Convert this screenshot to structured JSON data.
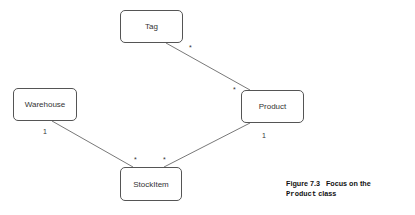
{
  "diagram": {
    "nodes": {
      "tag": "Tag",
      "warehouse": "Warehouse",
      "product": "Product",
      "stockitem": "StockItem"
    },
    "edges": [
      {
        "from": "Tag",
        "to": "Product",
        "from_mult": "*",
        "to_mult": "*"
      },
      {
        "from": "Warehouse",
        "to": "StockItem",
        "from_mult": "1",
        "to_mult": "*"
      },
      {
        "from": "Product",
        "to": "StockItem",
        "from_mult": "1",
        "to_mult": "*"
      }
    ],
    "multiplicities": {
      "tag_product_tag_end": "*",
      "tag_product_product_end": "*",
      "warehouse_end": "1",
      "warehouse_stock_end": "*",
      "product_end": "1",
      "product_stock_end": "*"
    }
  },
  "caption": {
    "number": "Figure 7.3",
    "text": "Focus on the",
    "code": "Product",
    "suffix": " class"
  }
}
